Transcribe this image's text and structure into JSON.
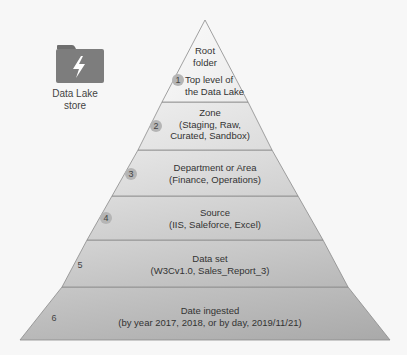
{
  "store": {
    "icon": "folder-lightning-icon",
    "label_line1": "Data Lake",
    "label_line2": "store"
  },
  "pyramid": {
    "layers": [
      {
        "number": "1",
        "title": "Root",
        "line2": "folder",
        "line3": "Top level of",
        "line4": "the Data Lake"
      },
      {
        "number": "2",
        "title": "Zone",
        "line2": "(Staging, Raw,",
        "line3": "Curated, Sandbox)"
      },
      {
        "number": "3",
        "title": "Department or Area",
        "line2": "(Finance, Operations)"
      },
      {
        "number": "4",
        "title": "Source",
        "line2": "(IIS, Saleforce, Excel)"
      },
      {
        "number": "5",
        "title": "Data set",
        "line2": "(W3Cv1.0, Sales_Report_3)"
      },
      {
        "number": "6",
        "title": "Date ingested",
        "line2": "(by year 2017, 2018, or by day, 2019/11/21)"
      }
    ]
  },
  "colors": {
    "layer_fills": [
      "#f4f4f4",
      "#e6e6e6",
      "#dcdcdc",
      "#d2d2d2",
      "#c6c6c6",
      "#bababa"
    ],
    "stroke": "#7a7a7a",
    "icon": "#7d7d7d"
  }
}
